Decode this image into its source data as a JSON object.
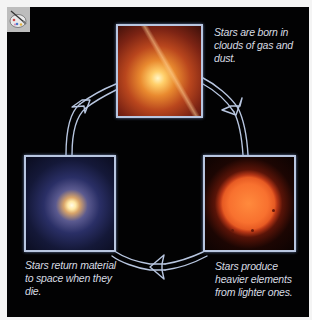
{
  "diagram": {
    "type": "cycle",
    "title": "",
    "background_color": "#020203",
    "arrow_color": "#b8c6e0",
    "stages": [
      {
        "id": "born",
        "image": "nebula-star-formation",
        "caption": "Stars are born in\nclouds of gas and\ndust."
      },
      {
        "id": "produce",
        "image": "red-sun",
        "caption": "Stars produce\nheavier elements\nfrom lighter ones."
      },
      {
        "id": "return",
        "image": "supernova-remnant",
        "caption": "Stars return material\nto space when they die."
      }
    ],
    "arrows": [
      {
        "from": "born",
        "to": "produce",
        "direction": "clockwise"
      },
      {
        "from": "produce",
        "to": "return",
        "direction": "clockwise"
      },
      {
        "from": "return",
        "to": "born",
        "direction": "clockwise"
      }
    ]
  },
  "icons": {
    "corner_icon": "paint-palette-icon"
  }
}
